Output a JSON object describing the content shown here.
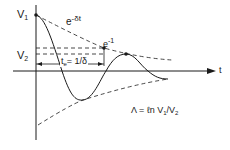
{
  "diagram": {
    "type": "damped-oscillation",
    "labels": {
      "v1": "V",
      "v1_sub": "1",
      "v2": "V",
      "v2_sub": "2",
      "envelope": "e",
      "envelope_exp": "-δt",
      "e_inv": "e",
      "e_inv_exp": "-1",
      "time_const": "t",
      "time_const_sub": "e",
      "time_const_eq": "= 1/δ",
      "t_axis": "t",
      "formula_lambda": "Λ = ℓn V",
      "formula_sub1": "1",
      "formula_mid": "/V",
      "formula_sub2": "2"
    },
    "colors": {
      "ink": "#1a1a1a",
      "background": "#ffffff"
    }
  }
}
